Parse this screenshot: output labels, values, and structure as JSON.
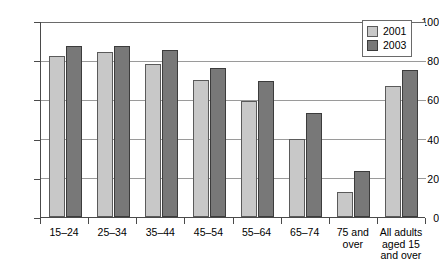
{
  "chart_data": {
    "type": "bar",
    "title": "",
    "xlabel": "",
    "ylabel": "",
    "ylim": [
      0,
      100
    ],
    "ytick_values": [
      0,
      20,
      40,
      60,
      80,
      100
    ],
    "ytick_labels": [
      "0",
      "20",
      "40",
      "60",
      "80",
      "100"
    ],
    "grid": true,
    "legend_position": "top-right",
    "categories": [
      "15–24",
      "25–34",
      "35–44",
      "45–54",
      "55–64",
      "65–74",
      "75 and over",
      "All adults aged 15 and over"
    ],
    "category_lines": [
      [
        "15–24"
      ],
      [
        "25–34"
      ],
      [
        "35–44"
      ],
      [
        "45–54"
      ],
      [
        "55–64"
      ],
      [
        "65–74"
      ],
      [
        "75 and",
        "over"
      ],
      [
        "All adults",
        "aged 15",
        "and over"
      ]
    ],
    "series": [
      {
        "name": "2001",
        "color": "#c8c8c8",
        "values": [
          82,
          84,
          78,
          70,
          59,
          40,
          13,
          67
        ]
      },
      {
        "name": "2003",
        "color": "#787878",
        "values": [
          87,
          87.5,
          85,
          76,
          69.5,
          53,
          23.5,
          75
        ]
      }
    ]
  },
  "legend": {
    "entries": [
      {
        "label": "2001",
        "color": "#c8c8c8"
      },
      {
        "label": "2003",
        "color": "#787878"
      }
    ]
  }
}
